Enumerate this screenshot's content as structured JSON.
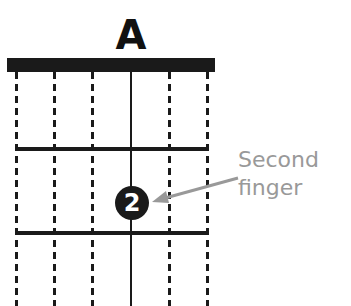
{
  "chord": {
    "name": "A"
  },
  "diagram": {
    "strings": [
      {
        "x": 16,
        "style": "muted"
      },
      {
        "x": 54,
        "style": "muted"
      },
      {
        "x": 92,
        "style": "muted"
      },
      {
        "x": 131,
        "style": "played"
      },
      {
        "x": 169,
        "style": "muted"
      },
      {
        "x": 207,
        "style": "muted"
      }
    ],
    "frets_y": [
      148,
      232
    ],
    "finger": {
      "number": "2",
      "string": 4,
      "fret": 2
    }
  },
  "annotation": {
    "line1": "Second",
    "line2": "finger",
    "color": "#999999"
  },
  "colors": {
    "ink": "#1a1a1a",
    "annotation": "#999999",
    "background": "#ffffff"
  }
}
